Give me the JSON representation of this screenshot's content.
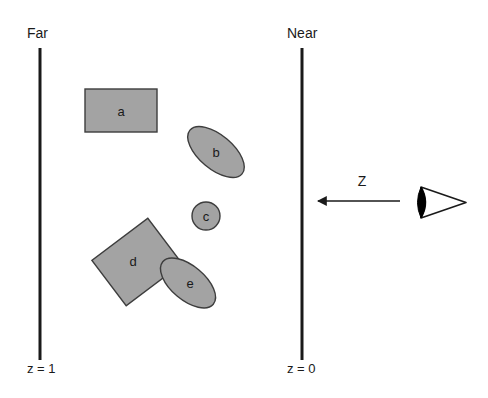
{
  "diagram": {
    "title_hidden": "",
    "planes": [
      {
        "id": "far-plane",
        "label": "Far",
        "depth_label": "z = 1",
        "x": 40,
        "y_top": 48,
        "y_bottom": 360,
        "label_x": 27,
        "label_y": 38,
        "depth_label_x": 27,
        "depth_label_y": 373,
        "color": "#1a1a1a",
        "thickness": 3
      },
      {
        "id": "near-plane",
        "label": "Near",
        "depth_label": "z = 0",
        "x": 302,
        "y_top": 48,
        "y_bottom": 360,
        "label_x": 287,
        "label_y": 38,
        "depth_label_x": 287,
        "depth_label_y": 373,
        "color": "#1a1a1a",
        "thickness": 3
      }
    ],
    "shapes": [
      {
        "id": "shape-a",
        "kind": "rectangle",
        "label": "a",
        "cx": 121,
        "cy": 110.5,
        "width": 72,
        "height": 43,
        "rotation": 0,
        "fill": "#a3a3a3",
        "stroke": "#3d3d3d",
        "label_x": 121,
        "label_y": 116
      },
      {
        "id": "shape-b",
        "kind": "ellipse",
        "label": "b",
        "cx": 216,
        "cy": 152,
        "rx": 34,
        "ry": 17,
        "rotation": 40,
        "fill": "#a3a3a3",
        "stroke": "#3d3d3d",
        "label_x": 216,
        "label_y": 157
      },
      {
        "id": "shape-c",
        "kind": "circle",
        "label": "c",
        "cx": 206,
        "cy": 216,
        "rx": 14,
        "ry": 14,
        "rotation": 0,
        "fill": "#a3a3a3",
        "stroke": "#3d3d3d",
        "label_x": 206,
        "label_y": 221
      },
      {
        "id": "shape-d",
        "kind": "rectangle",
        "label": "d",
        "cx": 137,
        "cy": 262,
        "width": 70,
        "height": 57,
        "rotation": -37,
        "fill": "#a3a3a3",
        "stroke": "#3d3d3d",
        "label_x": 133,
        "label_y": 266
      },
      {
        "id": "shape-e",
        "kind": "ellipse",
        "label": "e",
        "cx": 188,
        "cy": 283,
        "rx": 33,
        "ry": 17,
        "rotation": 40,
        "fill": "#a3a3a3",
        "stroke": "#3d3d3d",
        "label_x": 190,
        "label_y": 288
      }
    ],
    "direction_arrow": {
      "id": "z-axis-arrow",
      "label": "Z",
      "label_x": 362,
      "label_y": 186,
      "x_start": 400,
      "x_end": 318,
      "y": 201,
      "color": "#1a1a1a"
    },
    "viewer": {
      "id": "viewer-eye",
      "label": "",
      "apex_x": 466,
      "apex_y": 202,
      "back_x": 421,
      "top_y": 187,
      "bottom_y": 218,
      "pupil_fill": "#000000",
      "outline": "#1a1a1a"
    },
    "colors": {
      "background": "#ffffff",
      "shape_fill": "#a3a3a3",
      "shape_stroke": "#3d3d3d",
      "line": "#1a1a1a",
      "text": "#1a1a1a"
    }
  }
}
